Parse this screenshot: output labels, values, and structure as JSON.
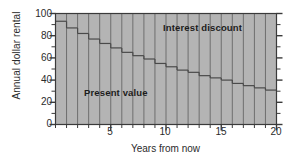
{
  "chart_data": {
    "type": "bar",
    "stacked": true,
    "title": "",
    "xlabel": "Years from now",
    "ylabel": "Annual dollar rental",
    "xlim": [
      0,
      20
    ],
    "ylim": [
      0,
      100
    ],
    "x_major_ticks": [
      5,
      10,
      15,
      20
    ],
    "x_tick_labels": [
      "5",
      "10",
      "15",
      "20"
    ],
    "x_minor_tick_step": 1,
    "y_major_ticks": [
      0,
      20,
      40,
      60,
      80,
      100
    ],
    "y_tick_labels": [
      "0",
      "20",
      "40",
      "60",
      "80",
      "100"
    ],
    "y_minor_tick_step": 10,
    "grid": false,
    "categories": [
      1,
      2,
      3,
      4,
      5,
      6,
      7,
      8,
      9,
      10,
      11,
      12,
      13,
      14,
      15,
      16,
      17,
      18,
      19,
      20
    ],
    "series": [
      {
        "name": "Present value",
        "color": "#b4b4b4",
        "values": [
          93,
          87,
          82,
          77,
          73,
          69,
          65,
          62,
          59,
          55,
          52,
          49,
          47,
          44,
          42,
          40,
          37,
          35,
          33,
          31
        ]
      },
      {
        "name": "Interest discount",
        "color": "#b4b4b4",
        "values": [
          7,
          13,
          18,
          23,
          27,
          31,
          35,
          38,
          41,
          45,
          48,
          51,
          53,
          56,
          58,
          60,
          63,
          65,
          67,
          69
        ]
      }
    ],
    "annotations": [
      {
        "text": "Present value",
        "x": 4.6,
        "y": 28
      },
      {
        "text": "Interest discount",
        "x": 13.1,
        "y": 87
      }
    ],
    "colors": {
      "bar_fill": "#b4b4b4",
      "bar_edge": "#6e6e6e",
      "step_line": "#4a4a4a",
      "axis": "#3a3a3a",
      "text": "#2b2b2b",
      "background": "#ffffff"
    }
  }
}
